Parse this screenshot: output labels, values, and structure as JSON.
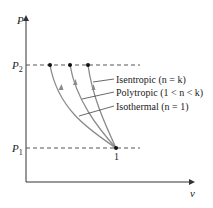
{
  "diagram": {
    "y_axis_label": "P",
    "x_axis_label": "v",
    "p2_label": "P",
    "p2_sub": "2",
    "p1_label": "P",
    "p1_sub": "1",
    "state_label": "1",
    "curves": [
      {
        "name": "Isentropic",
        "condition_pre": "(",
        "n": "n",
        "condition_post": " = k)",
        "label": "Isentropic (n = k)"
      },
      {
        "name": "Polytropic",
        "label": "Polytropic (1 < n < k)"
      },
      {
        "name": "Isothermal",
        "label": "Isothermal (n = 1)"
      }
    ],
    "colors": {
      "curve": "#8a8a8a",
      "axis": "#333333",
      "dash": "#555555",
      "dot": "#111111"
    }
  }
}
